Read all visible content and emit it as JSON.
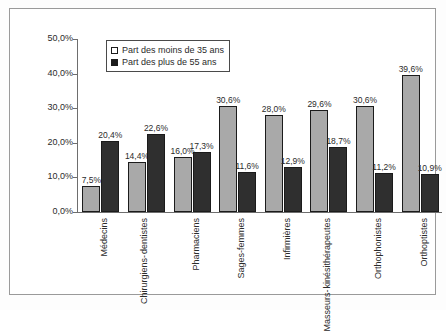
{
  "chart_data": {
    "type": "bar",
    "title": "",
    "xlabel": "",
    "ylabel": "",
    "ylim": [
      0,
      50
    ],
    "ytick_labels": [
      "0,0%",
      "10,0%",
      "20,0%",
      "30,0%",
      "40,0%",
      "50,0%"
    ],
    "ytick_values": [
      0,
      10,
      20,
      30,
      40,
      50
    ],
    "grid": false,
    "legend_position": "top-left-inside",
    "categories": [
      "Médecins",
      "Chirurgiens-dentistes",
      "Pharmaciens",
      "Sages-femmes",
      "Infirmières",
      "Masseurs-kinésithérapeutes",
      "Orthophonistes",
      "Orthoptistes"
    ],
    "category_lines": [
      [
        "Médecins"
      ],
      [
        "Chirurgiens-",
        "dentistes"
      ],
      [
        "Pharmaciens"
      ],
      [
        "Sages-femmes"
      ],
      [
        "Infirmières"
      ],
      [
        "Masseurs-",
        "kinésithérapeutes"
      ],
      [
        "Orthophonistes"
      ],
      [
        "Orthoptistes"
      ]
    ],
    "series": [
      {
        "name": "Part des moins de 35 ans",
        "color": "#a9a9a9",
        "values": [
          7.5,
          14.4,
          16.0,
          30.6,
          28.0,
          29.6,
          30.6,
          39.6
        ],
        "labels": [
          "7,5%",
          "14,4%",
          "16,0%",
          "30,6%",
          "28,0%",
          "29,6%",
          "30,6%",
          "39,6%"
        ]
      },
      {
        "name": "Part des plus de 55 ans",
        "color": "#2f2f2f",
        "values": [
          20.4,
          22.6,
          17.3,
          11.6,
          12.9,
          18.7,
          11.2,
          10.9
        ],
        "labels": [
          "20,4%",
          "22,6%",
          "17,3%",
          "11,6%",
          "12,9%",
          "18,7%",
          "11,2%",
          "10,9%"
        ]
      }
    ]
  },
  "legend": {
    "items": [
      {
        "label": "Part des moins de 35 ans",
        "swatch": "light"
      },
      {
        "label": "Part des plus de 55 ans",
        "swatch": "dark"
      }
    ]
  }
}
